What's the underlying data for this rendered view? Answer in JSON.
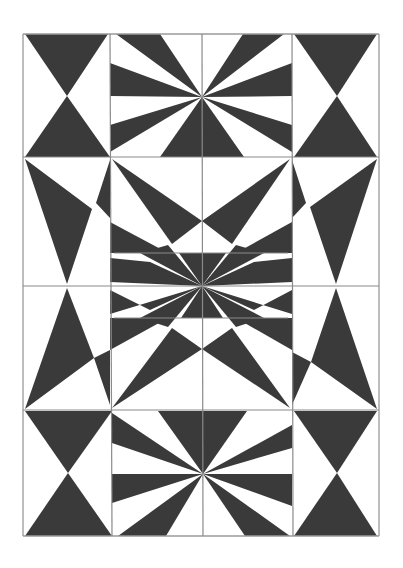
{
  "artwork": {
    "title": "Geometric symmetric pencil drawing",
    "description": "Black-and-white pencil-shaded geometric pattern of triangles, hourglasses and radiating bursts in a 3x4 grid",
    "colors": {
      "background": "#ffffff",
      "shade": "#3a3a3a",
      "line": "#8a8a8a",
      "border": "#9a9a9a"
    },
    "grid": {
      "columns": 3,
      "rows": 4
    },
    "panels": [
      {
        "name": "top-left-hourglass",
        "motif": "hourglass"
      },
      {
        "name": "top-center-burst",
        "motif": "radial-burst"
      },
      {
        "name": "top-right-hourglass",
        "motif": "hourglass"
      },
      {
        "name": "upper-left-kite",
        "motif": "inverted-triangle"
      },
      {
        "name": "center-star",
        "motif": "star-burst"
      },
      {
        "name": "upper-right-kite",
        "motif": "inverted-triangle"
      },
      {
        "name": "lower-left-kite",
        "motif": "triangle"
      },
      {
        "name": "lower-right-kite",
        "motif": "triangle"
      },
      {
        "name": "bottom-left-hourglass",
        "motif": "hourglass"
      },
      {
        "name": "bottom-center-burst",
        "motif": "radial-burst"
      },
      {
        "name": "bottom-right-hourglass",
        "motif": "hourglass"
      }
    ]
  }
}
